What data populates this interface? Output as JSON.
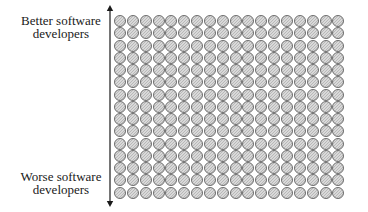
{
  "diagram": {
    "labels": {
      "top": [
        "Better software",
        "developers"
      ],
      "bottom": [
        "Worse software",
        "developers"
      ]
    },
    "axis": {
      "direction": "vertical",
      "arrowheads": [
        "top",
        "bottom"
      ],
      "color": "#1a1a1a"
    },
    "grid": {
      "rows": 15,
      "columns": 18,
      "item_shape": "circle",
      "item_fill": "#cfcfcf",
      "item_hatch": "diagonal",
      "item_stroke": "#6e6e6e"
    }
  }
}
